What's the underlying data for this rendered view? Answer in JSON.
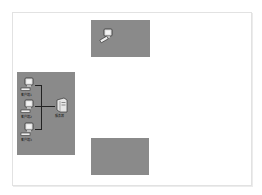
{
  "diagram": {
    "type": "network-topology",
    "zones": [
      {
        "id": "zone-top",
        "nodes": [
          {
            "type": "workstation",
            "label": ""
          }
        ]
      },
      {
        "id": "zone-left",
        "nodes": [
          {
            "type": "workstation",
            "label": "客户端1"
          },
          {
            "type": "workstation",
            "label": "客户端2"
          },
          {
            "type": "workstation",
            "label": "客户端3"
          },
          {
            "type": "server",
            "label": "服务器"
          }
        ]
      },
      {
        "id": "zone-bottom",
        "nodes": []
      }
    ],
    "colors": {
      "zone_fill": "#8a8a8a",
      "frame_border": "#e2e2e2",
      "background": "#ffffff"
    }
  }
}
